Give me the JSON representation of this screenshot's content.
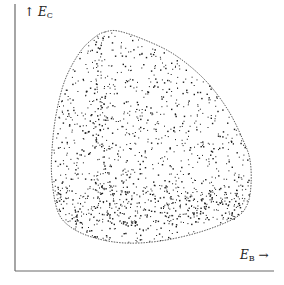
{
  "figure": {
    "y_axis": {
      "arrow": "↑",
      "symbol": "E",
      "subscript": "C"
    },
    "x_axis": {
      "symbol": "E",
      "subscript": "B",
      "arrow": "→"
    },
    "colors": {
      "axis": "#6a6a6a",
      "points": "#1a1a1a",
      "boundary": "#333333"
    }
  },
  "chart_data": {
    "type": "scatter",
    "title": "",
    "xlabel": "E_B →",
    "ylabel": "↑ E_C",
    "grid": false,
    "boundary_px": [
      [
        105,
        32
      ],
      [
        118,
        31
      ],
      [
        145,
        40
      ],
      [
        175,
        55
      ],
      [
        205,
        80
      ],
      [
        228,
        110
      ],
      [
        243,
        140
      ],
      [
        250,
        160
      ],
      [
        251,
        185
      ],
      [
        247,
        205
      ],
      [
        235,
        218
      ],
      [
        200,
        232
      ],
      [
        160,
        241
      ],
      [
        125,
        243
      ],
      [
        95,
        238
      ],
      [
        72,
        228
      ],
      [
        58,
        212
      ],
      [
        52,
        180
      ],
      [
        52,
        150
      ],
      [
        56,
        115
      ],
      [
        65,
        80
      ],
      [
        80,
        52
      ],
      [
        95,
        37
      ]
    ],
    "point_count_estimate": 1400
  }
}
